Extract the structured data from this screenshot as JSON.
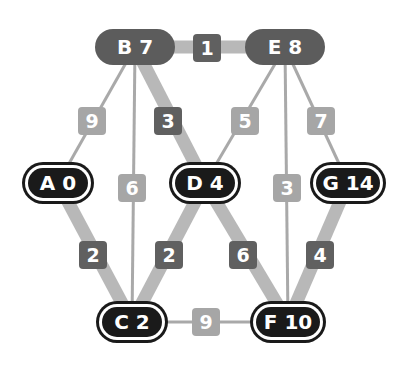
{
  "colors": {
    "background": "#ffffff",
    "thin_edge": "#a9a9a9",
    "thick_edge": "#b8b8b8",
    "light_label": "#a6a6a6",
    "dark_label": "#606060",
    "visited_node": "#1a1a1a",
    "frontier_node": "#5c5c5c"
  },
  "nodes": [
    {
      "id": "B",
      "label": "B 7",
      "x": 135,
      "y": 47,
      "w": 80,
      "style": "gray"
    },
    {
      "id": "E",
      "label": "E 8",
      "x": 285,
      "y": 47,
      "w": 80,
      "style": "gray"
    },
    {
      "id": "A",
      "label": "A 0",
      "x": 58,
      "y": 183,
      "w": 66,
      "style": "black"
    },
    {
      "id": "D",
      "label": "D 4",
      "x": 205,
      "y": 183,
      "w": 66,
      "style": "black"
    },
    {
      "id": "G",
      "label": "G 14",
      "x": 348,
      "y": 183,
      "w": 70,
      "style": "black"
    },
    {
      "id": "C",
      "label": "C 2",
      "x": 132,
      "y": 322,
      "w": 66,
      "style": "black"
    },
    {
      "id": "F",
      "label": "F 10",
      "x": 288,
      "y": 322,
      "w": 70,
      "style": "black"
    }
  ],
  "edges": [
    {
      "from": "B",
      "to": "E",
      "weight": "1",
      "thick": true,
      "lx": 207,
      "ly": 48
    },
    {
      "from": "B",
      "to": "A",
      "weight": "9",
      "thick": false,
      "lx": 92,
      "ly": 121
    },
    {
      "from": "B",
      "to": "D",
      "weight": "3",
      "thick": true,
      "lx": 168,
      "ly": 121
    },
    {
      "from": "B",
      "to": "C",
      "weight": "6",
      "thick": false,
      "lx": 132,
      "ly": 188
    },
    {
      "from": "E",
      "to": "D",
      "weight": "5",
      "thick": false,
      "lx": 245,
      "ly": 121
    },
    {
      "from": "E",
      "to": "G",
      "weight": "7",
      "thick": false,
      "lx": 321,
      "ly": 121
    },
    {
      "from": "E",
      "to": "F",
      "weight": "3",
      "thick": false,
      "lx": 287,
      "ly": 188
    },
    {
      "from": "A",
      "to": "C",
      "weight": "2",
      "thick": true,
      "lx": 93,
      "ly": 255
    },
    {
      "from": "D",
      "to": "C",
      "weight": "2",
      "thick": true,
      "lx": 169,
      "ly": 255
    },
    {
      "from": "D",
      "to": "F",
      "weight": "6",
      "thick": true,
      "lx": 243,
      "ly": 255
    },
    {
      "from": "G",
      "to": "F",
      "weight": "4",
      "thick": true,
      "lx": 320,
      "ly": 255
    },
    {
      "from": "C",
      "to": "F",
      "weight": "9",
      "thick": false,
      "lx": 206,
      "ly": 322
    }
  ]
}
